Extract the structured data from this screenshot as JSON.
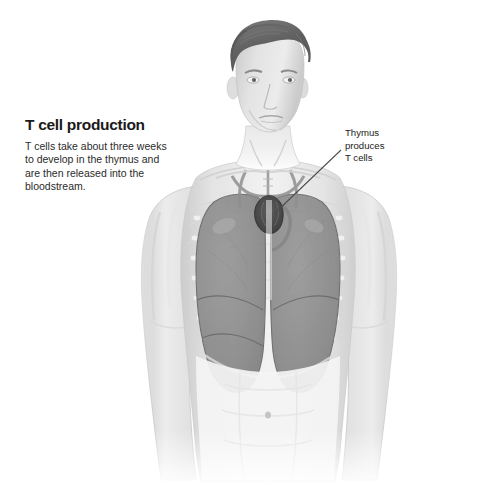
{
  "illustration": {
    "subject": "human male torso anatomy",
    "background_color": "#ffffff",
    "palette": {
      "skin_light": "#f2f2f2",
      "skin_mid": "#dcdcdc",
      "skin_shadow": "#c4c4c4",
      "hair": "#6b6b6b",
      "lung": "#8f8f8f",
      "lung_outline": "#6e6e6e",
      "thymus": "#4a4a4a",
      "vessel": "#9a9a9a",
      "leader_line": "#4d4d4d",
      "text": "#1a1a1a"
    }
  },
  "caption": {
    "title": "T cell production",
    "body": "T cells take about three weeks to develop in the thymus and are then released into the bloodstream."
  },
  "annotation": {
    "lines": [
      "Thymus",
      "produces",
      "T cells"
    ],
    "leader_from": {
      "x": 341,
      "y": 150
    },
    "leader_to": {
      "x": 274,
      "y": 214
    }
  },
  "anatomy_labels": {
    "head": "head",
    "neck": "neck",
    "trachea": "trachea",
    "left_lung": "left-lung",
    "right_lung": "right-lung",
    "thymus": "thymus",
    "diaphragm": "diaphragm",
    "ribcage": "ribcage",
    "left_arm": "left-arm",
    "right_arm": "right-arm",
    "abdomen": "abdomen",
    "navel": "navel"
  }
}
